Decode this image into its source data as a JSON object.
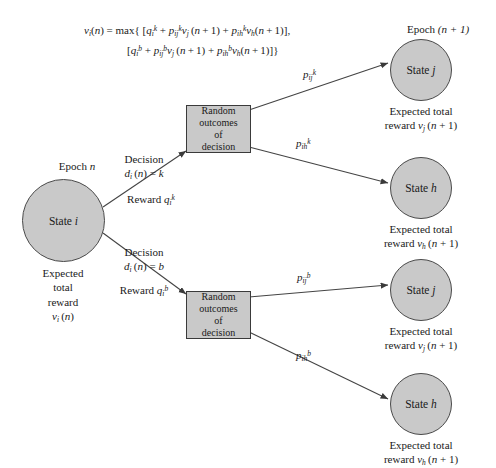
{
  "figure": {
    "type": "markov-decision-process-transition-diagram",
    "background": "#ffffff",
    "node_fill": "#c9c9c9",
    "node_stroke": "#4a4a4a",
    "box_fill": "#c9c9c9",
    "box_stroke": "#3a3a3a",
    "line_color": "#444444"
  },
  "formula": {
    "line1": "vᵢ(n) = max{ [qᵢᵏ + pᵢⱼᵏ vⱼ(n+1) + pᵢₕᵏ vₕ(n+1)],",
    "line2": "[qᵢᵇ + pᵢⱼᵇ vⱼ(n+1) + pᵢₕᵇ vₕ(n+1)] }",
    "parts": {
      "lhs": "v",
      "lhs_sub": "i",
      "lhs_arg": "(n) = max{ [",
      "q_k": "q",
      "q_k_sub": "i",
      "q_k_sup": "k",
      "p_ij_k": "p",
      "p_ij_k_sub": "ij",
      "p_ij_k_sup": "k",
      "p_ih_k": "p",
      "p_ih_k_sub": "ih",
      "p_ih_k_sup": "k",
      "q_b": "q",
      "q_b_sub": "i",
      "q_b_sup": "b",
      "p_ij_b_sub": "ij",
      "p_ij_b_sup": "b",
      "p_ih_b_sub": "ih",
      "p_ih_b_sup": "b",
      "vj": "v",
      "vj_sub": "j",
      "vh_sub": "h",
      "np1": "(n + 1)"
    }
  },
  "epochs": {
    "left_label": "Epoch",
    "left_value": "n",
    "right_label": "Epoch",
    "right_value": "(n + 1)"
  },
  "source_node": {
    "name": "State",
    "symbol": "i",
    "caption_line1": "Expected",
    "caption_line2": "total",
    "caption_line3": "reward",
    "caption_value": "v",
    "caption_value_sub": "i",
    "caption_value_arg": "(n)"
  },
  "decisions": [
    {
      "id": "decision-k",
      "title": "Decision",
      "expr_d": "d",
      "expr_d_sub": "i",
      "expr_rest": "(n) = k",
      "reward_label": "Reward",
      "reward_q": "q",
      "reward_sub": "i",
      "reward_sup": "k"
    },
    {
      "id": "decision-b",
      "title": "Decision",
      "expr_d": "d",
      "expr_d_sub": "i",
      "expr_rest": "(n) = b",
      "reward_label": "Reward",
      "reward_q": "q",
      "reward_sub": "i",
      "reward_sup": "b"
    }
  ],
  "random_boxes": [
    {
      "id": "random-outcomes-k",
      "line1": "Random",
      "line2": "outcomes",
      "line3": "of",
      "line4": "decision"
    },
    {
      "id": "random-outcomes-b",
      "line1": "Random",
      "line2": "outcomes",
      "line3": "of",
      "line4": "decision"
    }
  ],
  "probabilities": [
    {
      "id": "p-ij-k",
      "p": "p",
      "sub": "ij",
      "sup": "k"
    },
    {
      "id": "p-ih-k",
      "p": "p",
      "sub": "ih",
      "sup": "k"
    },
    {
      "id": "p-ij-b",
      "p": "p",
      "sub": "ij",
      "sup": "b"
    },
    {
      "id": "p-ih-b",
      "p": "p",
      "sub": "ih",
      "sup": "b"
    }
  ],
  "target_nodes": [
    {
      "id": "state-j-top",
      "name": "State",
      "symbol": "j",
      "caption_line1": "Expected total",
      "caption_reward": "reward",
      "caption_v": "v",
      "caption_sub": "j",
      "caption_arg": "(n + 1)"
    },
    {
      "id": "state-h-upper",
      "name": "State",
      "symbol": "h",
      "caption_line1": "Expected total",
      "caption_reward": "reward",
      "caption_v": "v",
      "caption_sub": "h",
      "caption_arg": "(n + 1)"
    },
    {
      "id": "state-j-lower",
      "name": "State",
      "symbol": "j",
      "caption_line1": "Expected total",
      "caption_reward": "reward",
      "caption_v": "v",
      "caption_sub": "j",
      "caption_arg": "(n + 1)"
    },
    {
      "id": "state-h-bottom",
      "name": "State",
      "symbol": "h",
      "caption_line1": "Expected total",
      "caption_reward": "reward",
      "caption_v": "v",
      "caption_sub": "h",
      "caption_arg": "(n + 1)"
    }
  ]
}
